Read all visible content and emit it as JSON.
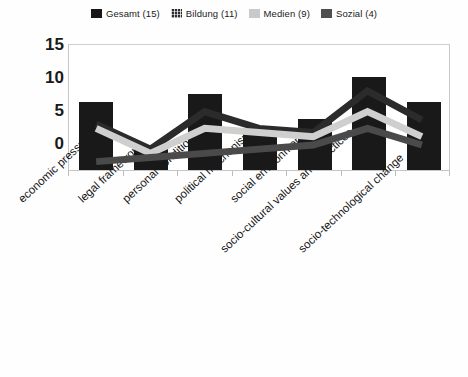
{
  "legend": {
    "position": "top-center",
    "items": [
      {
        "label": "Gesamt (15)",
        "icon": "square-swatch-solid-black",
        "color": "#171717",
        "style": "bar-solid"
      },
      {
        "label": "Bildung (11)",
        "icon": "square-swatch-crosshatch",
        "color": "#2b2b2b",
        "style": "line-dark-hatched"
      },
      {
        "label": "Medien (9)",
        "icon": "square-swatch-light-gray",
        "color": "#c9c9c9",
        "style": "line-light-gray"
      },
      {
        "label": "Sozial (4)",
        "icon": "square-swatch-dark-gray",
        "color": "#4f4f4f",
        "style": "line-dark-gray"
      }
    ]
  },
  "axes": {
    "y_ticks": [
      "15",
      "10",
      "5",
      "0"
    ],
    "y_min": 0,
    "y_max": 15,
    "y_step": 5
  },
  "chart_data": {
    "type": "bar",
    "title": "",
    "subtitle": "",
    "xlabel": "",
    "ylabel": "",
    "ylim": [
      0,
      15
    ],
    "yticks": [
      0,
      5,
      10,
      15
    ],
    "grid": false,
    "legend_position": "top-center",
    "categories": [
      "economic pressure",
      "legal framework",
      "personal conditions",
      "political mechanisms",
      "social environment",
      "socio-cultural values and practices",
      "socio-technological change"
    ],
    "series": [
      {
        "name": "Gesamt (15)",
        "type": "bar",
        "color": "#191919",
        "values": [
          8,
          3,
          9,
          5,
          6,
          11,
          8
        ]
      },
      {
        "name": "Bildung (11)",
        "type": "line",
        "color": "#2b2b2b",
        "values": [
          5.5,
          2.5,
          7,
          5,
          4.5,
          9.5,
          6
        ]
      },
      {
        "name": "Medien (9)",
        "type": "line",
        "color": "#c9c9c9",
        "values": [
          5,
          2,
          5,
          4.5,
          4,
          7,
          4
        ]
      },
      {
        "name": "Sozial (4)",
        "type": "line",
        "color": "#4f4f4f",
        "values": [
          1,
          1.5,
          2,
          2.5,
          3,
          5,
          3
        ]
      }
    ]
  }
}
